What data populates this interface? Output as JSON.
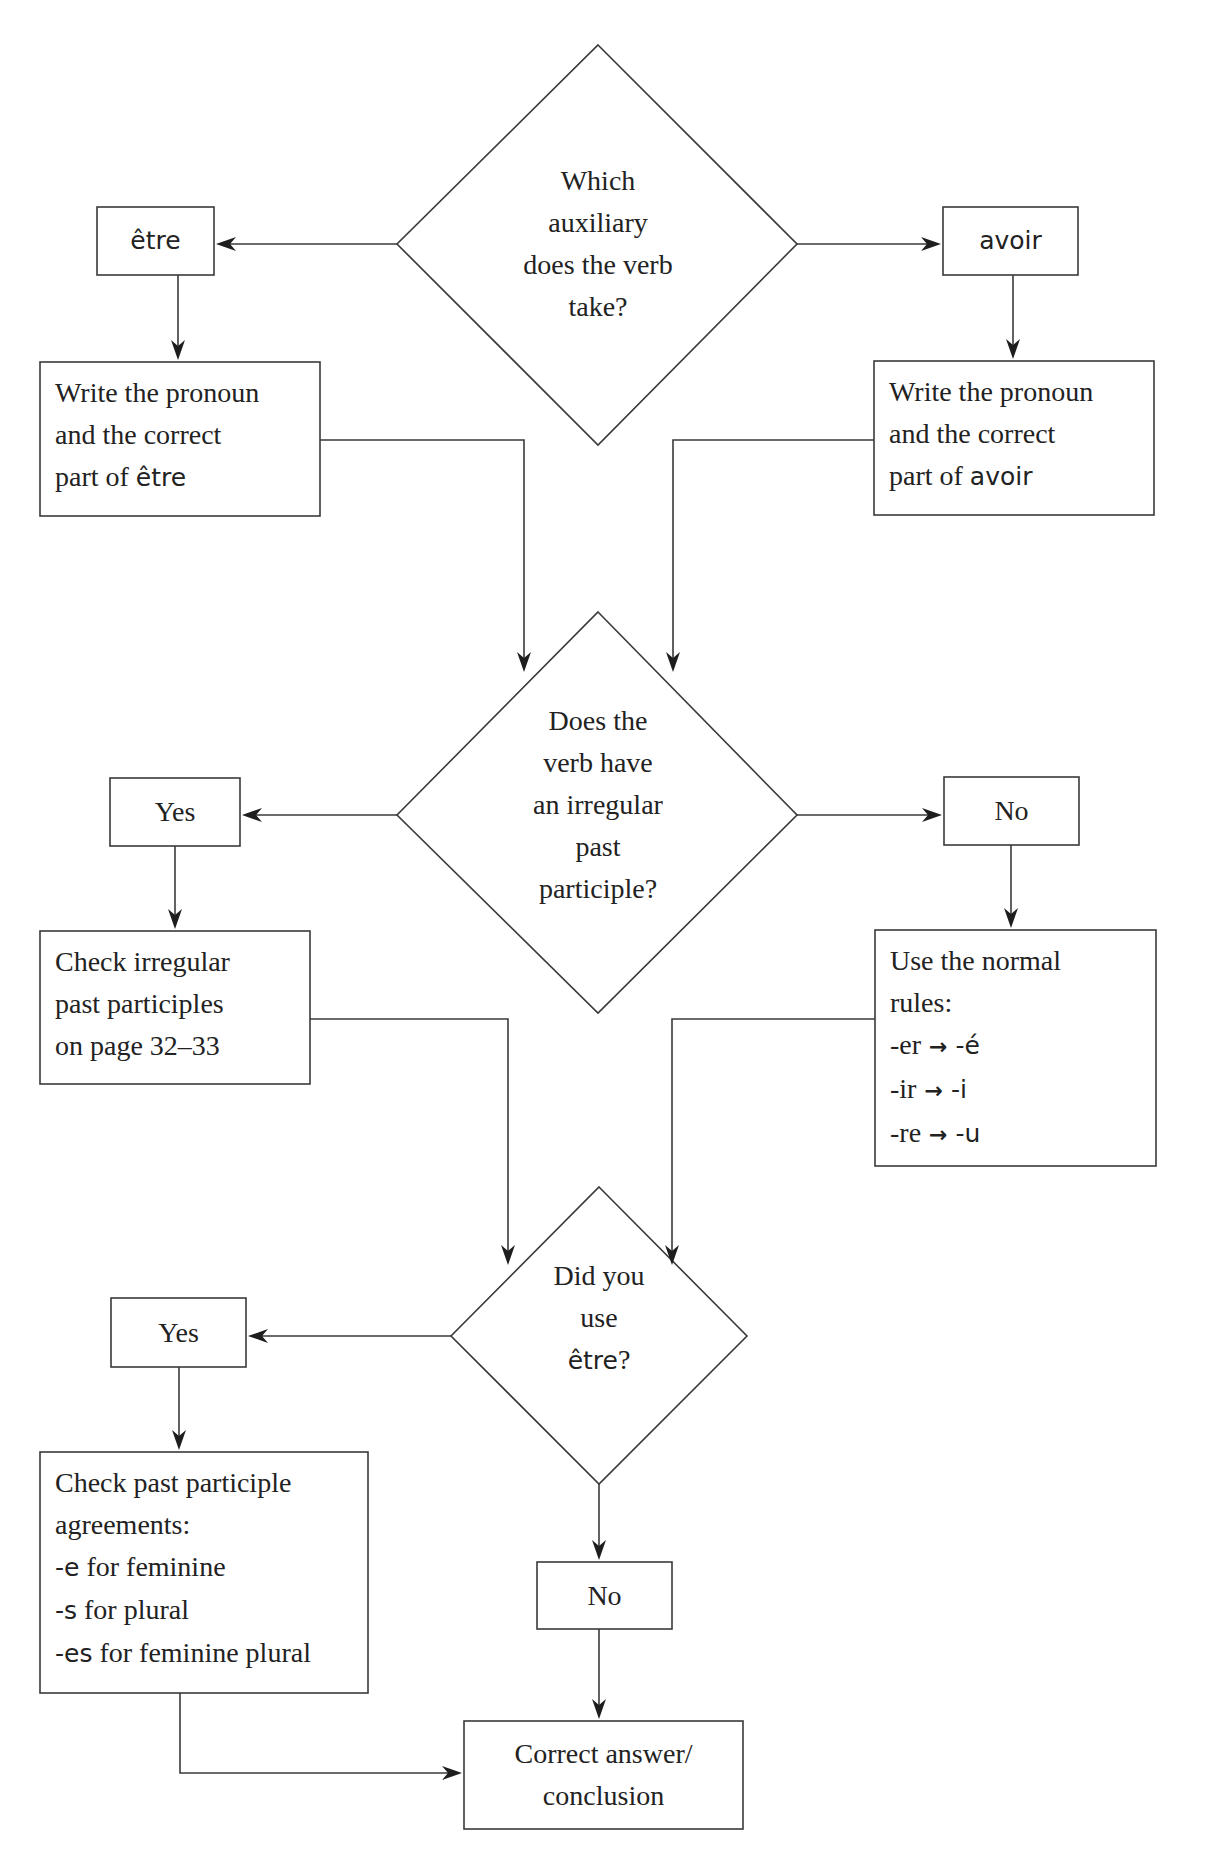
{
  "diagram": {
    "type": "flowchart",
    "top_cutoff_text": "",
    "decisions": {
      "auxiliary": {
        "lines": [
          "Which",
          "auxiliary",
          "does the verb",
          "take?"
        ]
      },
      "irregular": {
        "lines": [
          "Does the",
          "verb have",
          "an irregular",
          "past",
          "participle?"
        ]
      },
      "used_etre": {
        "lines": [
          "Did you",
          "use"
        ],
        "last_word": "être",
        "last_suffix": "?"
      }
    },
    "branches": {
      "etre": {
        "label": "être"
      },
      "avoir": {
        "label": "avoir"
      },
      "irregular_yes": {
        "label": "Yes"
      },
      "irregular_no": {
        "label": "No"
      },
      "etre_yes": {
        "label": "Yes"
      },
      "etre_no": {
        "label": "No"
      }
    },
    "actions": {
      "write_etre": {
        "lines": [
          "Write the pronoun",
          "and the correct"
        ],
        "last_prefix": "part of ",
        "last_word": "être"
      },
      "write_avoir": {
        "lines": [
          "Write the pronoun",
          "and the correct"
        ],
        "last_prefix": "part of ",
        "last_word": "avoir"
      },
      "check_irregular": {
        "lines": [
          "Check irregular",
          "past participles",
          "on page 32–33"
        ]
      },
      "normal_rules": {
        "lines": [
          "Use the normal",
          "rules:"
        ],
        "rules": [
          {
            "from": "-er",
            "arrow": "→",
            "to": "-é"
          },
          {
            "from": "-ir",
            "arrow": "→",
            "to": "-i"
          },
          {
            "from": "-re",
            "arrow": "→",
            "to": "-u"
          }
        ]
      },
      "agreements": {
        "lines": [
          "Check past participle",
          "agreements:"
        ],
        "rules": [
          {
            "ending": "-e",
            "text": " for feminine"
          },
          {
            "ending": "-s",
            "text": " for plural"
          },
          {
            "ending": "-es",
            "text": " for feminine plural"
          }
        ]
      },
      "conclusion": {
        "lines": [
          "Correct answer/",
          "conclusion"
        ]
      }
    },
    "edges": [
      {
        "from": "auxiliary",
        "to": "etre"
      },
      {
        "from": "auxiliary",
        "to": "avoir"
      },
      {
        "from": "etre",
        "to": "write_etre"
      },
      {
        "from": "avoir",
        "to": "write_avoir"
      },
      {
        "from": "write_etre",
        "to": "irregular"
      },
      {
        "from": "write_avoir",
        "to": "irregular"
      },
      {
        "from": "irregular",
        "to": "irregular_yes"
      },
      {
        "from": "irregular",
        "to": "irregular_no"
      },
      {
        "from": "irregular_yes",
        "to": "check_irregular"
      },
      {
        "from": "irregular_no",
        "to": "normal_rules"
      },
      {
        "from": "check_irregular",
        "to": "used_etre"
      },
      {
        "from": "normal_rules",
        "to": "used_etre"
      },
      {
        "from": "used_etre",
        "to": "etre_yes"
      },
      {
        "from": "used_etre",
        "to": "etre_no"
      },
      {
        "from": "etre_yes",
        "to": "agreements"
      },
      {
        "from": "etre_no",
        "to": "conclusion"
      },
      {
        "from": "agreements",
        "to": "conclusion"
      }
    ],
    "colors": {
      "stroke": "#3a3a3a",
      "text": "#222222",
      "background": "#ffffff"
    }
  }
}
